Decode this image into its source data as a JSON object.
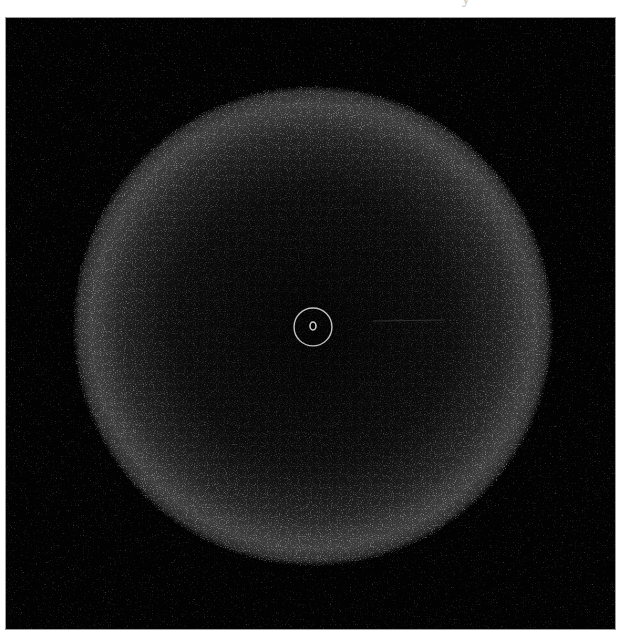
{
  "figure": {
    "background_color": "#020202",
    "border_color": "#9a9a9a",
    "disk": {
      "center_x": 308,
      "center_y": 309,
      "radius": 240,
      "limb_color": "#5a5a5a",
      "center_color": "#101010"
    },
    "marker": {
      "outer_ring_radius": 19,
      "inner_ring_rx": 3,
      "inner_ring_ry": 4,
      "color": "#d8d8d8"
    }
  },
  "header_fragment": {
    "text": "y"
  }
}
